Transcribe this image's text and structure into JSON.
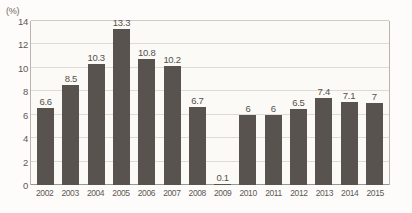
{
  "chart_data": {
    "type": "bar",
    "title": "",
    "subtitle": "",
    "xlabel": "",
    "ylabel": "",
    "unit_label": "(%)",
    "categories": [
      "2002",
      "2003",
      "2004",
      "2005",
      "2006",
      "2007",
      "2008",
      "2009",
      "2010",
      "2011",
      "2012",
      "2013",
      "2014",
      "2015"
    ],
    "values": [
      6.6,
      8.5,
      10.3,
      13.3,
      10.8,
      10.2,
      6.7,
      0.1,
      6,
      6,
      6.5,
      7.4,
      7.1,
      7
    ],
    "data_labels": [
      "6.6",
      "8.5",
      "10.3",
      "13.3",
      "10.8",
      "10.2",
      "6.7",
      "0.1",
      "6",
      "6",
      "6.5",
      "7.4",
      "7.1",
      "7"
    ],
    "ylim": [
      0,
      14
    ],
    "yticks": [
      0,
      2,
      4,
      6,
      8,
      10,
      12,
      14
    ],
    "ytick_labels": [
      "0",
      "2",
      "4",
      "6",
      "8",
      "10",
      "12",
      "14"
    ],
    "grid": true,
    "grid_axis": "y",
    "legend": false,
    "legend_position": "none",
    "bar_color": "#58534e",
    "grid_color": "#dedbd5",
    "axis_color": "#9b968f",
    "background_color": "#fbfaf7",
    "text_color": "#55514b"
  }
}
